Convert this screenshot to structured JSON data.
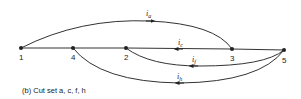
{
  "diagram": {
    "caption": "(b)  Cut set a, c, f, h",
    "nodes": [
      {
        "id": "1",
        "x": 21,
        "y": 48
      },
      {
        "id": "4",
        "x": 73,
        "y": 48
      },
      {
        "id": "2",
        "x": 126,
        "y": 48
      },
      {
        "id": "3",
        "x": 232,
        "y": 49
      },
      {
        "id": "5",
        "x": 284,
        "y": 50
      }
    ],
    "branches": [
      {
        "label": "i",
        "sub": "a",
        "from": "1",
        "to": "3"
      },
      {
        "label": "i",
        "sub": "c",
        "from": "2",
        "to": "3"
      },
      {
        "label": "i",
        "sub": "f",
        "from": "2",
        "to": "5"
      },
      {
        "label": "i",
        "sub": "h",
        "from": "4",
        "to": "5"
      }
    ]
  }
}
